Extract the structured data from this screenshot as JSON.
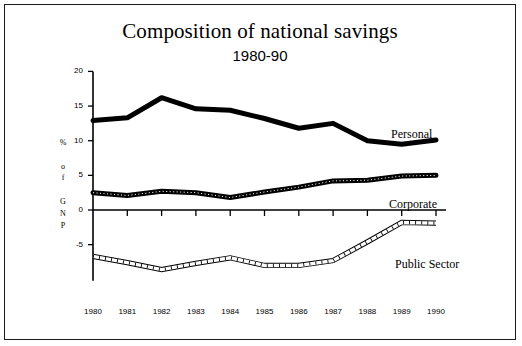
{
  "chart_data": {
    "type": "line",
    "title": "Composition of national savings",
    "subtitle": "1980-90",
    "xlabel": "",
    "ylabel": "% of GNP",
    "ylabel_chars": [
      "%",
      "o",
      "f",
      "G",
      "N",
      "P"
    ],
    "categories": [
      "1980",
      "1981",
      "1982",
      "1983",
      "1984",
      "1985",
      "1986",
      "1987",
      "1988",
      "1989",
      "1990"
    ],
    "x": [
      1980,
      1981,
      1982,
      1983,
      1984,
      1985,
      1986,
      1987,
      1988,
      1989,
      1990
    ],
    "ylim": [
      -10,
      20
    ],
    "yticks": [
      20,
      15,
      10,
      5,
      0,
      -5
    ],
    "ytick_labels": [
      "20",
      "15",
      "10",
      "5",
      "0",
      "-5"
    ],
    "grid": false,
    "legend": "inline-right",
    "zero_line": true,
    "series": [
      {
        "name": "Personal",
        "style": "solid-thick-black",
        "color": "#000000",
        "values": [
          12.9,
          13.3,
          16.2,
          14.6,
          14.4,
          13.2,
          11.8,
          12.5,
          10.0,
          9.5,
          10.1
        ]
      },
      {
        "name": "Corporate",
        "style": "thick-hatched-black",
        "color": "#000000",
        "values": [
          2.5,
          2.1,
          2.7,
          2.5,
          1.8,
          2.6,
          3.3,
          4.2,
          4.3,
          4.9,
          5.0
        ]
      },
      {
        "name": "Public Sector",
        "style": "outlined-hatched-white",
        "color": "#000000",
        "values": [
          -6.7,
          -7.6,
          -8.6,
          -7.7,
          -6.9,
          -8.0,
          -8.0,
          -7.3,
          -4.6,
          -1.8,
          -1.9
        ]
      }
    ]
  }
}
